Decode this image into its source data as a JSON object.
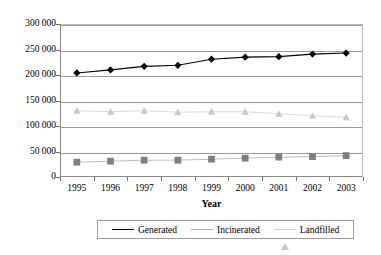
{
  "chart_data": {
    "type": "line",
    "title": "",
    "xlabel": "Year",
    "ylabel": "",
    "categories": [
      "1995",
      "1996",
      "1997",
      "1998",
      "1999",
      "2000",
      "2001",
      "2002",
      "2003"
    ],
    "ylim": [
      0,
      300000
    ],
    "ytick_values": [
      0,
      50000,
      100000,
      150000,
      200000,
      250000,
      300000
    ],
    "ytick_labels": [
      "0",
      "50 000",
      "100 000",
      "150 000",
      "200 000",
      "250 000",
      "300 000"
    ],
    "grid": true,
    "legend_position": "bottom",
    "series": [
      {
        "name": "Generated",
        "marker": "diamond",
        "color": "#000000",
        "values": [
          204000,
          210000,
          217000,
          219000,
          231000,
          235000,
          236000,
          241000,
          243000
        ]
      },
      {
        "name": "Incinerated",
        "marker": "square",
        "color": "#808080",
        "values": [
          29000,
          31000,
          33000,
          33000,
          35000,
          37000,
          39000,
          40000,
          42000
        ]
      },
      {
        "name": "Landfilled",
        "marker": "triangle",
        "color": "#c8c8c8",
        "values": [
          130000,
          128000,
          130000,
          127000,
          128000,
          128000,
          124000,
          120000,
          117000
        ]
      }
    ]
  },
  "legend": {
    "items": [
      {
        "label": "Generated"
      },
      {
        "label": "Incinerated"
      },
      {
        "label": "Landfilled"
      }
    ]
  },
  "axes": {
    "x_title": "Year"
  }
}
